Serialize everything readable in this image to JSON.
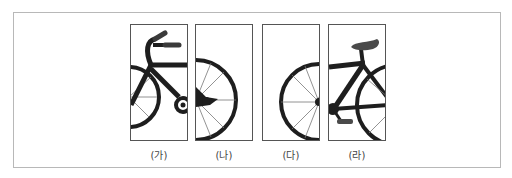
{
  "figure": {
    "panels": [
      {
        "id": "ga",
        "label": "(가)",
        "content": "front-left: handlebar and front of frame, part of rear wheel"
      },
      {
        "id": "na",
        "label": "(나)",
        "content": "right half of wheel with hub"
      },
      {
        "id": "da",
        "label": "(다)",
        "content": "left half of wheel with hub"
      },
      {
        "id": "ra",
        "label": "(라)",
        "content": "seat, frame, pedal and part of wheel"
      }
    ],
    "colors": {
      "bike": "#1e1e1e",
      "grip": "#3a3a3a",
      "seat": "#4a4a4a",
      "spoke": "#777777",
      "panel_border": "#555555",
      "frame_border": "#b8b8b8"
    }
  }
}
